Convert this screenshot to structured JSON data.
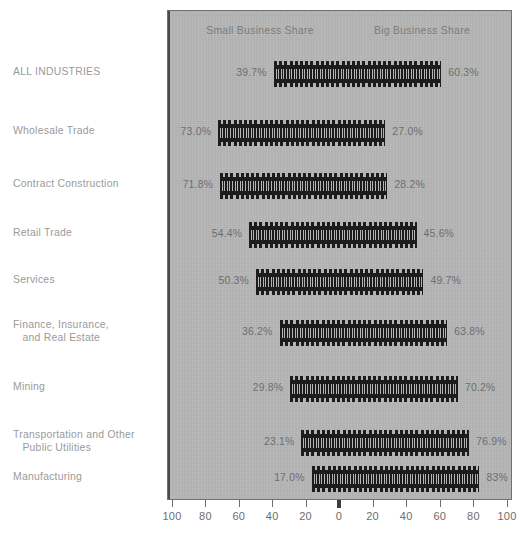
{
  "chart_data": {
    "type": "bar",
    "subtype": "diverging-pictogram",
    "title": "",
    "xlabel": "",
    "ylabel": "",
    "grid": false,
    "legend_position": "top-inside",
    "axis": {
      "tick_values": [
        -100,
        -80,
        -60,
        -40,
        -20,
        0,
        20,
        40,
        60,
        80,
        100
      ],
      "tick_labels": [
        "100",
        "80",
        "60",
        "40",
        "20",
        "0",
        "20",
        "40",
        "60",
        "80",
        "100"
      ],
      "xlim": [
        -100,
        100
      ]
    },
    "headers": {
      "left": "Small Business Share",
      "right": "Big Business Share"
    },
    "series": [
      {
        "name": "Small Business Share",
        "values": [
          39.7,
          73.0,
          71.8,
          54.4,
          50.3,
          36.2,
          29.8,
          23.1,
          17.0
        ]
      },
      {
        "name": "Big Business Share",
        "values": [
          60.3,
          27.0,
          28.2,
          45.6,
          49.7,
          63.8,
          70.2,
          76.9,
          83.0
        ]
      }
    ],
    "categories": [
      "ALL INDUSTRIES",
      "Wholesale Trade",
      "Contract Construction",
      "Retail Trade",
      "Services",
      "Finance, Insurance,\n   and Real Estate",
      "Mining",
      "Transportation and Other\n   Public Utilities",
      "Manufacturing"
    ],
    "rows": [
      {
        "category": "ALL INDUSTRIES",
        "left_value": 39.7,
        "right_value": 60.3,
        "left_label": "39.7%",
        "right_label": "60.3%"
      },
      {
        "category": "Wholesale Trade",
        "left_value": 73.0,
        "right_value": 27.0,
        "left_label": "73.0%",
        "right_label": "27.0%"
      },
      {
        "category": "Contract Construction",
        "left_value": 71.8,
        "right_value": 28.2,
        "left_label": "71.8%",
        "right_label": "28.2%"
      },
      {
        "category": "Retail Trade",
        "left_value": 54.4,
        "right_value": 45.6,
        "left_label": "54.4%",
        "right_label": "45.6%"
      },
      {
        "category": "Services",
        "left_value": 50.3,
        "right_value": 49.7,
        "left_label": "50.3%",
        "right_label": "49.7%"
      },
      {
        "category": "Finance, Insurance,\n   and Real Estate",
        "left_value": 36.2,
        "right_value": 63.8,
        "left_label": "36.2%",
        "right_label": "63.8%"
      },
      {
        "category": "Mining",
        "left_value": 29.8,
        "right_value": 70.2,
        "left_label": "29.8%",
        "right_label": "70.2%"
      },
      {
        "category": "Transportation and Other\n   Public Utilities",
        "left_value": 23.1,
        "right_value": 76.9,
        "left_label": "23.1%",
        "right_label": "76.9%"
      },
      {
        "category": "Manufacturing",
        "left_value": 17.0,
        "right_value": 83.0,
        "left_label": "17.0%",
        "right_label": "83%"
      }
    ]
  },
  "colors": {
    "panel_background": "#b6b6b6",
    "panel_border": "#707070",
    "pictogram": "#1c1c1c",
    "zero_axis": "#4b4b4b",
    "label_text": "#9a9a9a",
    "value_text": "#6e6e6e",
    "page_background": "#ffffff"
  }
}
